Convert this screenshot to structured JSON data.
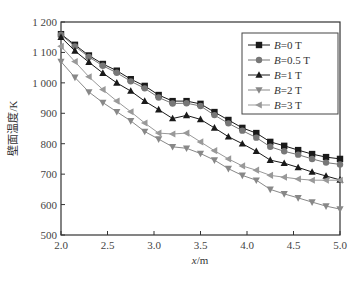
{
  "chart_data": {
    "type": "line",
    "title": "",
    "xlabel": "x/m",
    "xlabel_italic_part": "x",
    "xlabel_unit": "/m",
    "ylabel": "壁面温度/K",
    "xlim": [
      2.0,
      5.0
    ],
    "ylim": [
      500,
      1200
    ],
    "x_ticks": [
      2.0,
      2.5,
      3.0,
      3.5,
      4.0,
      4.5,
      5.0
    ],
    "x_tick_labels": [
      "2.0",
      "2.5",
      "3.0",
      "3.5",
      "4.0",
      "4.5",
      "5.0"
    ],
    "y_ticks": [
      500,
      600,
      700,
      800,
      900,
      1000,
      1100,
      1200
    ],
    "y_tick_labels": [
      "500",
      "600",
      "700",
      "800",
      "900",
      "1 000",
      "1 100",
      "1 200"
    ],
    "grid": false,
    "legend_position": "upper right",
    "x": [
      2.0,
      2.15,
      2.3,
      2.45,
      2.6,
      2.75,
      2.9,
      3.05,
      3.2,
      3.35,
      3.5,
      3.65,
      3.8,
      3.95,
      4.1,
      4.25,
      4.4,
      4.55,
      4.7,
      4.85,
      5.0
    ],
    "series": [
      {
        "name": "B=0 T",
        "marker": "square",
        "color": "#1a1a1a",
        "values": [
          1160,
          1125,
          1090,
          1062,
          1040,
          1012,
          990,
          960,
          940,
          940,
          931,
          904,
          878,
          852,
          835,
          806,
          793,
          779,
          766,
          756,
          750
        ]
      },
      {
        "name": "B=0.5 T",
        "marker": "circle",
        "color": "#777777",
        "values": [
          1158,
          1120,
          1085,
          1056,
          1033,
          1005,
          982,
          952,
          932,
          933,
          924,
          894,
          867,
          843,
          820,
          790,
          775,
          764,
          750,
          738,
          732
        ]
      },
      {
        "name": "B=1 T",
        "marker": "triangle-up",
        "color": "#1a1a1a",
        "values": [
          1150,
          1105,
          1068,
          1032,
          1000,
          973,
          940,
          912,
          883,
          893,
          880,
          852,
          823,
          800,
          775,
          746,
          736,
          722,
          707,
          694,
          681
        ]
      },
      {
        "name": "B=2 T",
        "marker": "triangle-down",
        "color": "#888888",
        "values": [
          1070,
          1018,
          970,
          935,
          905,
          875,
          840,
          815,
          790,
          785,
          768,
          746,
          718,
          696,
          680,
          650,
          635,
          622,
          608,
          595,
          585
        ]
      },
      {
        "name": "B=3 T",
        "marker": "triangle-left",
        "color": "#999999",
        "values": [
          1120,
          1070,
          1020,
          978,
          940,
          905,
          868,
          835,
          832,
          835,
          806,
          777,
          750,
          727,
          713,
          696,
          690,
          684,
          680,
          680,
          680
        ]
      }
    ]
  },
  "legend": {
    "items": [
      {
        "label_var": "B",
        "label_rest": "=0 T"
      },
      {
        "label_var": "B",
        "label_rest": "=0.5 T"
      },
      {
        "label_var": "B",
        "label_rest": "=1 T"
      },
      {
        "label_var": "B",
        "label_rest": "=2 T"
      },
      {
        "label_var": "B",
        "label_rest": "=3 T"
      }
    ]
  },
  "axes": {
    "ylabel_text": "壁面温度/K",
    "xlabel_var": "x",
    "xlabel_unit": "/m"
  }
}
